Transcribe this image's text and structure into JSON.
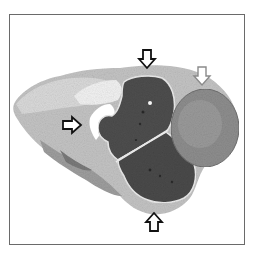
{
  "figure": {
    "type": "histology-micrograph",
    "colormode": "grayscale",
    "frame": {
      "border_color": "#6a6a6a",
      "background": "#ffffff"
    },
    "colors": {
      "dark_mass": "#4a4a4a",
      "round_nodule": "#8c8c8c",
      "connective_tissue": "#b4b4b4",
      "pale_tissue": "#d2d2d2",
      "lumen": "#ffffff"
    },
    "annotations": [
      {
        "id": "arrow-top",
        "style": "black-outline",
        "direction": "down",
        "x": 147,
        "y": 60
      },
      {
        "id": "arrow-top-right",
        "style": "white-outline",
        "direction": "down",
        "x": 202,
        "y": 77
      },
      {
        "id": "arrow-left",
        "style": "black-outline",
        "direction": "right",
        "x": 73,
        "y": 125
      },
      {
        "id": "arrow-bottom",
        "style": "black-outline",
        "direction": "up",
        "x": 154,
        "y": 221
      }
    ]
  }
}
